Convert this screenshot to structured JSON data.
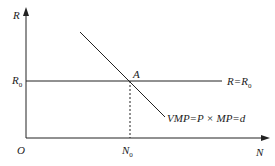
{
  "diagram": {
    "y_axis_label": "R",
    "x_axis_label": "N",
    "origin_label": "O",
    "r0_label": "R",
    "r0_sub": "0",
    "n0_label": "N",
    "n0_sub": "0",
    "point_label": "A",
    "horizontal_line_label": "R=R",
    "horizontal_line_sub": "0",
    "demand_line_label": "VMP=P × MP=d",
    "colors": {
      "line": "#222222",
      "background": "#ffffff"
    }
  }
}
